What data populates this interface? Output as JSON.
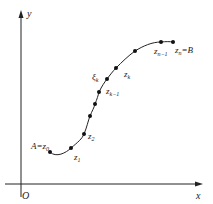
{
  "diagram": {
    "axes": {
      "x_label": "x",
      "y_label": "y",
      "origin_label": "O"
    },
    "labels": {
      "start": "A=z",
      "start_sub": "0",
      "z1": "z",
      "z1_sub": "1",
      "z2": "z",
      "z2_sub": "2",
      "xi_k": "ξ",
      "xi_k_sub": "k",
      "z_k_minus_1": "z",
      "z_k_minus_1_sub": "k−1",
      "z_k": "z",
      "z_k_sub": "k",
      "z_n_minus_1": "z",
      "z_n_minus_1_sub": "n−1",
      "end": "z",
      "end_sub": "n",
      "end_suffix": "=B"
    },
    "points": [
      {
        "name": "A=z0",
        "x": 50,
        "y": 152
      },
      {
        "name": "z1",
        "x": 71,
        "y": 148
      },
      {
        "name": "z2",
        "x": 84,
        "y": 134
      },
      {
        "name": "p3",
        "x": 90,
        "y": 116
      },
      {
        "name": "p4",
        "x": 95,
        "y": 104
      },
      {
        "name": "z_k-1",
        "x": 99,
        "y": 92
      },
      {
        "name": "xi_k",
        "x": 107,
        "y": 79
      },
      {
        "name": "z_k",
        "x": 116,
        "y": 68
      },
      {
        "name": "p8",
        "x": 135,
        "y": 51
      },
      {
        "name": "z_n-1",
        "x": 161,
        "y": 42
      },
      {
        "name": "z_n=B",
        "x": 173,
        "y": 42
      }
    ],
    "colors": {
      "stroke": "#222222",
      "background": "#ffffff"
    }
  }
}
